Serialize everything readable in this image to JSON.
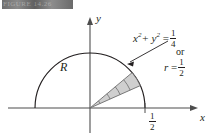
{
  "figure": {
    "header_strip_text": "FIGURE 14.26",
    "region_label": "R",
    "axis_x_label": "x",
    "axis_y_label": "y",
    "tick_label_half": {
      "numerator": "1",
      "denominator": "2"
    },
    "annotation": {
      "equation_lhs": "x",
      "equation_exp1": "2",
      "equation_plus": "+ y",
      "equation_exp2": "2",
      "equation_eq": "=",
      "equation_fraction": {
        "numerator": "1",
        "denominator": "4"
      },
      "connector_word": "or",
      "polar_lhs": "r",
      "polar_eq": "=",
      "polar_fraction": {
        "numerator": "1",
        "denominator": "2"
      }
    },
    "colors": {
      "stroke": "#231f20",
      "wedge_fill": "#cfcfcf",
      "wedge_stroke": "#6d6d6d",
      "background": "#ffffff",
      "header_band": "#6f6f6f"
    },
    "geometry": {
      "origin_x": 90,
      "origin_y": 108,
      "radius": 55,
      "wedge_angle_start_deg": 24,
      "wedge_angle_end_deg": 40,
      "wedge_subdivisions": 5
    }
  }
}
